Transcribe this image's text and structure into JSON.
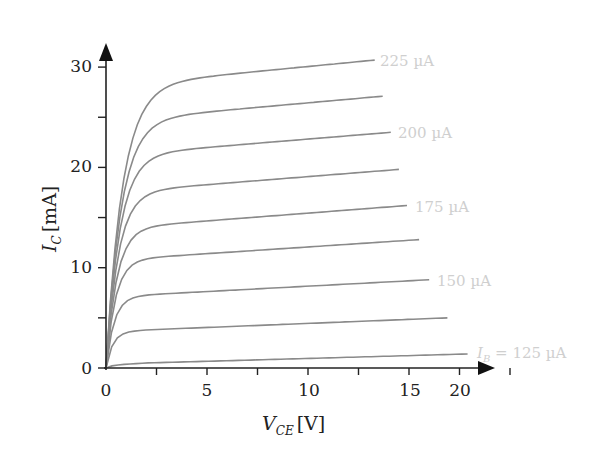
{
  "chart_data": {
    "type": "line",
    "title": "",
    "xlabel": "V_CE [V]",
    "ylabel": "I_C [mA]",
    "xlabel_parts": {
      "main": "V",
      "sub": "CE",
      "unit": "[V]"
    },
    "ylabel_parts": {
      "main": "I",
      "sub": "C",
      "unit": "[mA]"
    },
    "xlim": [
      0,
      21
    ],
    "ylim": [
      0,
      32
    ],
    "x_ticks": [
      0,
      2.5,
      5,
      7.5,
      10,
      12.5,
      15,
      17.5,
      20
    ],
    "x_tick_labels": [
      "0",
      "5",
      "10",
      "15",
      "20"
    ],
    "x_tick_label_values": [
      0,
      5,
      10,
      15,
      20
    ],
    "y_ticks": [
      0,
      5,
      10,
      15,
      20,
      25,
      30
    ],
    "y_tick_labels": [
      "0",
      "10",
      "20",
      "30"
    ],
    "y_tick_label_values": [
      0,
      10,
      20,
      30
    ],
    "grid": false,
    "legend": "inline labels at curve ends",
    "series": [
      {
        "name": "IB=125 µA",
        "label": "I_B = 125 µA",
        "knee": 0.5,
        "end_v": 17.9,
        "end_i": 1.4
      },
      {
        "name": "IB≈131 µA",
        "label": "",
        "knee": 3.8,
        "end_v": 16.9,
        "end_i": 5.0
      },
      {
        "name": "IB=150 µA",
        "label": "150 µA",
        "knee": 7.3,
        "end_v": 16.0,
        "end_i": 8.8
      },
      {
        "name": "IB≈162 µA",
        "label": "",
        "knee": 11.0,
        "end_v": 15.5,
        "end_i": 12.8
      },
      {
        "name": "IB=175 µA",
        "label": "175 µA",
        "knee": 14.2,
        "end_v": 14.9,
        "end_i": 16.2
      },
      {
        "name": "IB≈187 µA",
        "label": "",
        "knee": 17.8,
        "end_v": 14.5,
        "end_i": 19.8
      },
      {
        "name": "IB=200 µA",
        "label": "200 µA",
        "knee": 21.5,
        "end_v": 14.1,
        "end_i": 23.5
      },
      {
        "name": "IB≈212 µA",
        "label": "",
        "knee": 25.0,
        "end_v": 13.7,
        "end_i": 27.1
      },
      {
        "name": "IB=225 µA",
        "label": "225 µA",
        "knee": 28.5,
        "end_v": 13.3,
        "end_i": 30.7
      }
    ]
  },
  "labels": {
    "x_title_main": "V",
    "x_title_sub": "CE",
    "x_title_unit": "[V]",
    "y_title_main": "I",
    "y_title_sub": "C",
    "y_title_unit": "[mA]",
    "ib_symbol": "I",
    "ib_sub": "B",
    "ib_eq": " = 125 µA",
    "l150": "150 µA",
    "l175": "175 µA",
    "l200": "200 µA",
    "l225": "225 µA"
  },
  "colors": {
    "axis": "#222222",
    "curve": "#8a8a8a",
    "label": "#cfcfcf"
  }
}
